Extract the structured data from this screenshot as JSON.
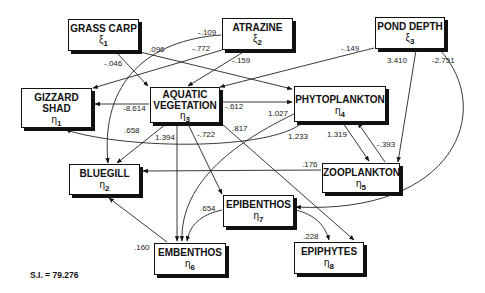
{
  "nodes": {
    "grass_carp": {
      "name": "GRASS CARP",
      "symbol": "ξ",
      "sub": "1"
    },
    "atrazine": {
      "name": "ATRAZINE",
      "symbol": "ξ",
      "sub": "2"
    },
    "pond_depth": {
      "name": "POND DEPTH",
      "symbol": "ξ",
      "sub": "3"
    },
    "gizzard_shad": {
      "name_line1": "GIZZARD",
      "name_line2": "SHAD",
      "symbol": "η",
      "sub": "1"
    },
    "aquatic_vegetation": {
      "name_line1": "AQUATIC",
      "name_line2": "VEGETATION",
      "symbol": "η",
      "sub": "3"
    },
    "phytoplankton": {
      "name": "PHYTOPLANKTON",
      "symbol": "η",
      "sub": "4"
    },
    "bluegill": {
      "name": "BLUEGILL",
      "symbol": "η",
      "sub": "2"
    },
    "zooplankton": {
      "name": "ZOOPLANKTON",
      "symbol": "η",
      "sub": "5"
    },
    "epibenthos": {
      "name": "EPIBENTHOS",
      "symbol": "η",
      "sub": "7"
    },
    "embenthos": {
      "name": "EMBENTHOS",
      "symbol": "η",
      "sub": "6"
    },
    "epiphytes": {
      "name": "EPIPHYTES",
      "symbol": "η",
      "sub": "8"
    }
  },
  "edges": [
    {
      "from": "grass_carp",
      "to": "aquatic_vegetation",
      "coef": "-.046"
    },
    {
      "from": "grass_carp",
      "to": "phytoplankton",
      "coef": ".096"
    },
    {
      "from": "atrazine",
      "to": "bluegill",
      "coef": "-.109"
    },
    {
      "from": "atrazine",
      "to": "gizzard_shad",
      "coef": "-.772"
    },
    {
      "from": "atrazine",
      "to": "aquatic_vegetation",
      "coef": "-.159"
    },
    {
      "from": "pond_depth",
      "to": "aquatic_vegetation",
      "coef": "-.149"
    },
    {
      "from": "pond_depth",
      "to": "zooplankton",
      "coef": "3.410"
    },
    {
      "from": "pond_depth",
      "to": "epibenthos",
      "coef": "-2.751"
    },
    {
      "from": "aquatic_vegetation",
      "to": "gizzard_shad",
      "coef": "-8.614"
    },
    {
      "from": "aquatic_vegetation",
      "to": "phytoplankton",
      "coef": "-.612"
    },
    {
      "from": "aquatic_vegetation",
      "to": "bluegill",
      "coef": ".658"
    },
    {
      "from": "aquatic_vegetation",
      "to": "embenthos",
      "coef": "1.394"
    },
    {
      "from": "aquatic_vegetation",
      "to": "epibenthos",
      "coef": "-.722"
    },
    {
      "from": "aquatic_vegetation",
      "to": "epiphytes",
      "coef": ".817"
    },
    {
      "from": "phytoplankton",
      "to": "embenthos",
      "coef": "1.027"
    },
    {
      "from": "gizzard_shad",
      "to": "phytoplankton",
      "coef": "1.233"
    },
    {
      "from": "phytoplankton",
      "to": "zooplankton",
      "coef": "1.319"
    },
    {
      "from": "zooplankton",
      "to": "phytoplankton",
      "coef": "-.393"
    },
    {
      "from": "zooplankton",
      "to": "bluegill",
      "coef": ".176"
    },
    {
      "from": "epibenthos",
      "to": "embenthos",
      "coef": ".654"
    },
    {
      "from": "epibenthos",
      "to": "epiphytes",
      "coef": ".228"
    },
    {
      "from": "embenthos",
      "to": "bluegill",
      "coef": ".160"
    }
  ],
  "fit_index": "S.I. = 79.276"
}
